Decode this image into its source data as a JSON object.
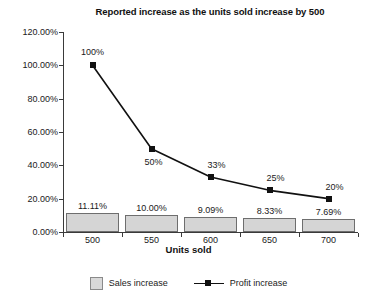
{
  "chart_data": {
    "type": "bar",
    "title": "Reported increase as the units sold increase by 500",
    "xlabel": "Units sold",
    "ylabel": "",
    "categories": [
      "500",
      "550",
      "600",
      "650",
      "700"
    ],
    "ylim": [
      0,
      120
    ],
    "ytick_labels": [
      "0.00%",
      "20.00%",
      "40.00%",
      "60.00%",
      "80.00%",
      "100.00%",
      "120.00%"
    ],
    "ytick_values": [
      0,
      20,
      40,
      60,
      80,
      100,
      120
    ],
    "grid": false,
    "legend_position": "bottom",
    "series": [
      {
        "name": "Sales increase",
        "type": "bar",
        "values": [
          11.11,
          10.0,
          9.09,
          8.33,
          7.69
        ],
        "labels": [
          "11.11%",
          "10.00%",
          "9.09%",
          "8.33%",
          "7.69%"
        ],
        "color": "#d5d5d5"
      },
      {
        "name": "Profit increase",
        "type": "line",
        "values": [
          100,
          50,
          33,
          25,
          20
        ],
        "labels": [
          "100%",
          "50%",
          "33%",
          "25%",
          "20%"
        ],
        "color": "#111111"
      }
    ]
  },
  "legend": {
    "items": [
      {
        "label": "Sales increase"
      },
      {
        "label": "Profit increase"
      }
    ]
  }
}
